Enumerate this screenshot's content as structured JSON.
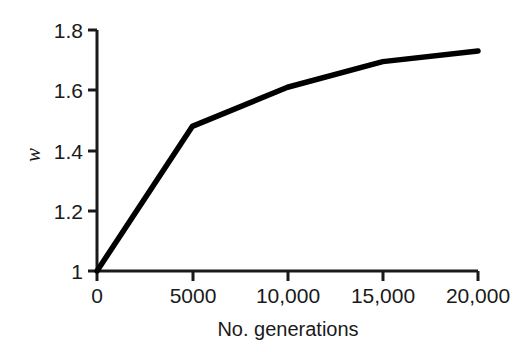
{
  "chart_data": {
    "type": "line",
    "title": "",
    "xlabel": "No. generations",
    "ylabel": "w",
    "xlim": [
      0,
      20000
    ],
    "ylim": [
      1.0,
      1.8
    ],
    "grid": false,
    "legend": false,
    "x": [
      0,
      5000,
      10000,
      15000,
      20000
    ],
    "series": [
      {
        "name": "mean fitness",
        "values": [
          1.0,
          1.48,
          1.61,
          1.695,
          1.73
        ],
        "color": "#000000"
      }
    ],
    "xticks": [
      0,
      5000,
      10000,
      15000,
      20000
    ],
    "xtick_labels": [
      "0",
      "5000",
      "10,000",
      "15,000",
      "20,000"
    ],
    "yticks": [
      1.0,
      1.2,
      1.4,
      1.6,
      1.8
    ],
    "ytick_labels": [
      "1",
      "1.2",
      "1.4",
      "1.6",
      "1.8"
    ],
    "annotations": []
  },
  "axes": {
    "x_title": "No. generations",
    "y_title": "w",
    "x_tick_0": "0",
    "x_tick_1": "5000",
    "x_tick_2": "10,000",
    "x_tick_3": "15,000",
    "x_tick_4": "20,000",
    "y_tick_0": "1",
    "y_tick_1": "1.2",
    "y_tick_2": "1.4",
    "y_tick_3": "1.6",
    "y_tick_4": "1.8"
  },
  "colors": {
    "background": "#ffffff",
    "foreground": "#1a1a1a",
    "line": "#000000"
  }
}
